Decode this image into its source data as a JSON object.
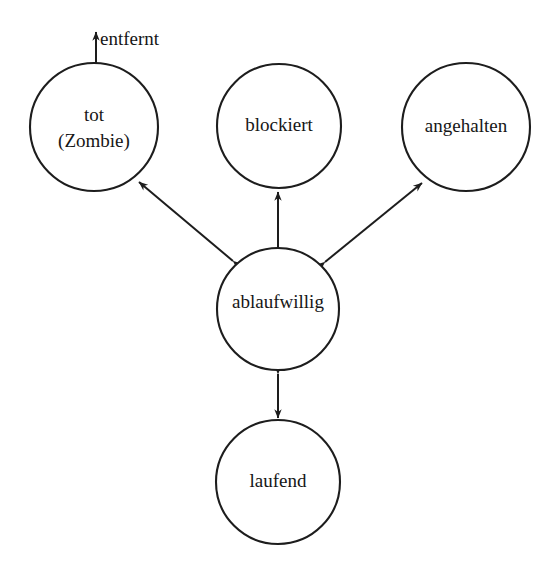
{
  "diagram": {
    "type": "state-transition-diagram",
    "language": "de",
    "background_color": "#ffffff",
    "stroke_color": "#1d1d1d",
    "text_color": "#161616",
    "states": [
      {
        "id": "tot",
        "label_line1": "tot",
        "label_line2": "(Zombie)",
        "cx": 94,
        "cy": 127,
        "r": 64
      },
      {
        "id": "blockiert",
        "label_line1": "blockiert",
        "label_line2": "",
        "cx": 279,
        "cy": 126,
        "r": 62
      },
      {
        "id": "angehalten",
        "label_line1": "angehalten",
        "label_line2": "",
        "cx": 466,
        "cy": 127,
        "r": 64
      },
      {
        "id": "ablaufwillig",
        "label_line1": "ablaufwillig",
        "label_line2": "",
        "cx": 278,
        "cy": 309,
        "r": 61
      },
      {
        "id": "laufend",
        "label_line1": "laufend",
        "label_line2": "",
        "cx": 278,
        "cy": 482,
        "r": 62
      }
    ],
    "transitions": [
      {
        "id": "ablaufwillig-tot",
        "from": "ablaufwillig",
        "to": "tot",
        "direction": "bidirectional",
        "label": ""
      },
      {
        "id": "ablaufwillig-blockiert",
        "from": "ablaufwillig",
        "to": "blockiert",
        "direction": "bidirectional",
        "label": ""
      },
      {
        "id": "ablaufwillig-angehalten",
        "from": "ablaufwillig",
        "to": "angehalten",
        "direction": "bidirectional",
        "label": ""
      },
      {
        "id": "ablaufwillig-laufend",
        "from": "ablaufwillig",
        "to": "laufend",
        "direction": "bidirectional",
        "label": ""
      },
      {
        "id": "tot-entfernt",
        "from": "tot",
        "to": "",
        "direction": "outgoing",
        "label": "entfernt"
      }
    ]
  }
}
